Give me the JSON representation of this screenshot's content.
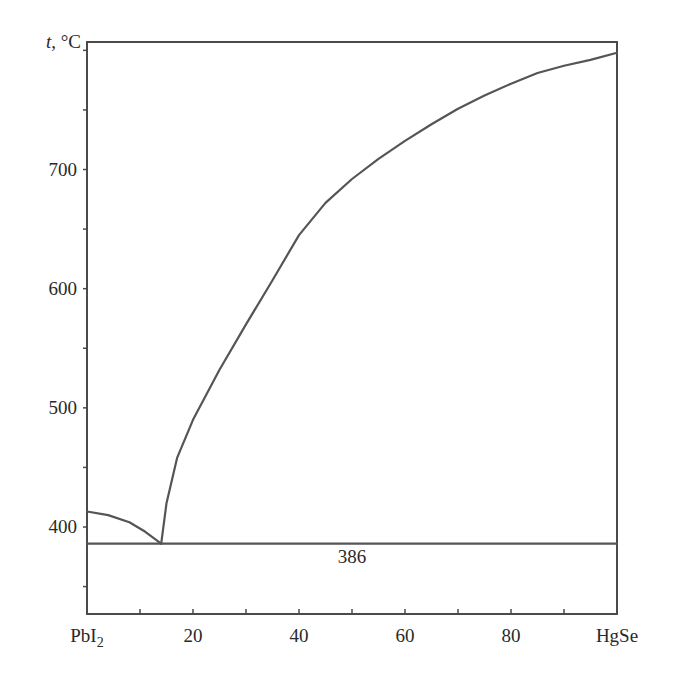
{
  "chart_data": {
    "type": "line",
    "title": "",
    "xlabel": "",
    "ylabel": "t, °C",
    "x_left_label": "PbI2",
    "x_right_label": "HgSe",
    "xlim": [
      0,
      100
    ],
    "ylim": [
      327,
      807
    ],
    "x_ticks": [
      20,
      40,
      60,
      80
    ],
    "x_tick_labels": [
      "PbI2",
      "20",
      "40",
      "60",
      "80",
      "HgSe"
    ],
    "x_minor_step": 10,
    "y_ticks": [
      400,
      500,
      600,
      700
    ],
    "y_tick_labels": [
      "400",
      "500",
      "600",
      "700"
    ],
    "y_minor_step": 50,
    "grid": false,
    "legend": null,
    "annotations": [
      {
        "text": "386",
        "x": 50,
        "y": 375
      }
    ],
    "series": [
      {
        "name": "liquidus-PbI2",
        "x": [
          0,
          4,
          8,
          11,
          14
        ],
        "y": [
          413,
          410,
          404,
          396,
          386
        ]
      },
      {
        "name": "liquidus-HgSe",
        "x": [
          14,
          15,
          17,
          20,
          25,
          30,
          35,
          40,
          45,
          50,
          55,
          60,
          65,
          70,
          75,
          80,
          85,
          90,
          95,
          100
        ],
        "y": [
          386,
          420,
          458,
          490,
          532,
          570,
          607,
          645,
          672,
          692,
          709,
          724,
          738,
          751,
          762,
          772,
          781,
          787,
          792,
          798
        ]
      },
      {
        "name": "eutectic-line",
        "x": [
          0,
          100
        ],
        "y": [
          386,
          386
        ]
      }
    ]
  }
}
